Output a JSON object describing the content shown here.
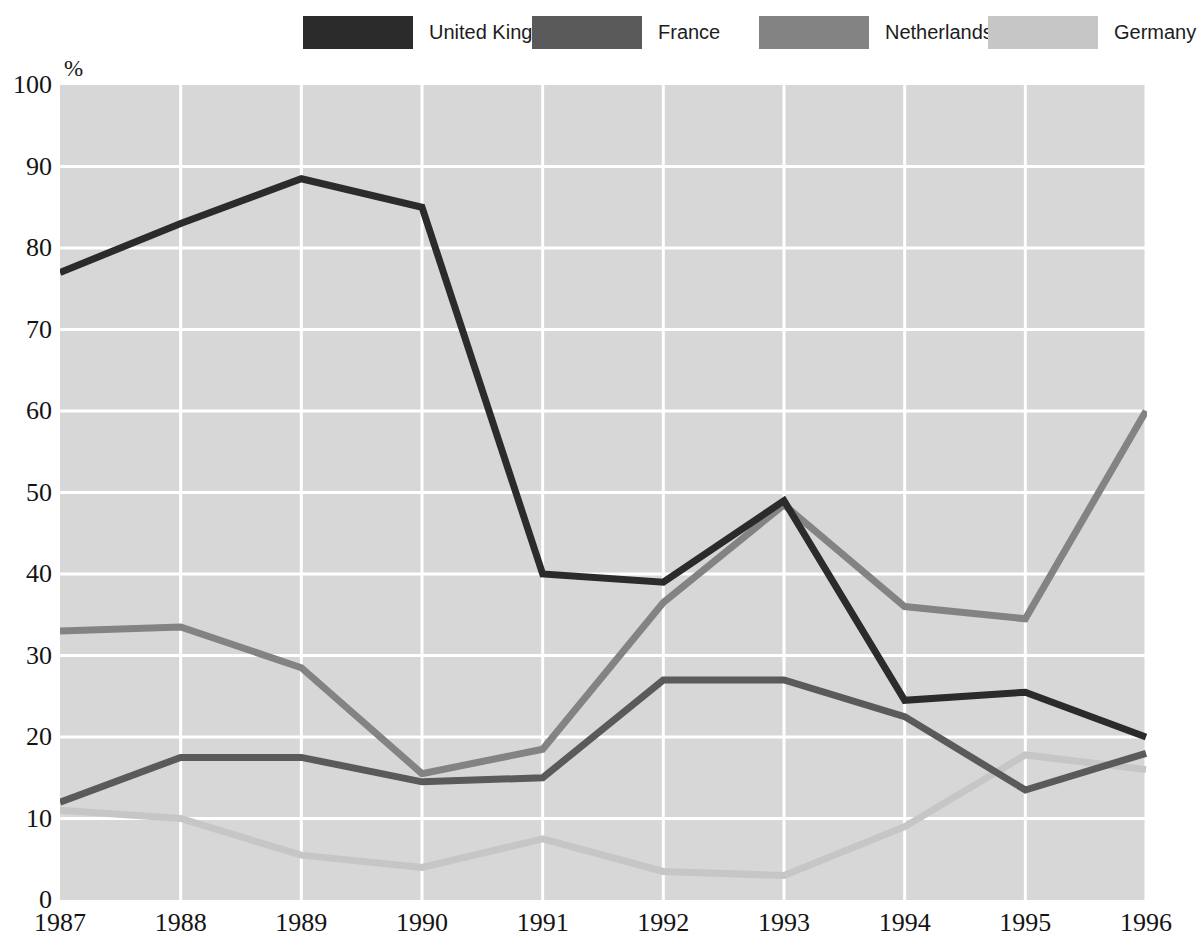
{
  "chart_data": {
    "type": "line",
    "title": "",
    "xlabel": "",
    "ylabel": "%",
    "unit_label": "%",
    "categories": [
      1987,
      1988,
      1989,
      1990,
      1991,
      1992,
      1993,
      1994,
      1995,
      1996
    ],
    "x_tick_labels": [
      "1987",
      "1988",
      "1989",
      "1990",
      "1991",
      "1992",
      "1993",
      "1994",
      "1995",
      "1996"
    ],
    "y_tick_labels": [
      "100",
      "90",
      "80",
      "70",
      "60",
      "50",
      "40",
      "30",
      "20",
      "10",
      "0"
    ],
    "y_ticks": [
      100,
      90,
      80,
      70,
      60,
      50,
      40,
      30,
      20,
      10,
      0
    ],
    "ylim": [
      0,
      100
    ],
    "grid": true,
    "grid_color": "#ffffff",
    "plot_background": "#d7d7d7",
    "legend_position": "top",
    "series": [
      {
        "name": "United Kingdom",
        "color": "#2b2b2b",
        "values": [
          77,
          83,
          88.5,
          85,
          40,
          39,
          49,
          24.5,
          25.5,
          20
        ]
      },
      {
        "name": "France",
        "color": "#5a5a5a",
        "values": [
          12,
          17.5,
          17.5,
          14.5,
          15,
          27,
          27,
          22.5,
          13.5,
          18
        ]
      },
      {
        "name": "Netherlands",
        "color": "#838383",
        "values": [
          33,
          33.5,
          28.5,
          15.5,
          18.5,
          36.5,
          48.5,
          36,
          34.5,
          60
        ]
      },
      {
        "name": "Germany",
        "color": "#c6c6c6",
        "values": [
          11,
          10,
          5.5,
          4,
          7.5,
          3.5,
          3,
          9,
          17.8,
          16
        ]
      }
    ]
  },
  "legend": {
    "items": [
      {
        "label": "United Kingdom",
        "color": "#2b2b2b"
      },
      {
        "label": "France",
        "color": "#5a5a5a"
      },
      {
        "label": "Netherlands",
        "color": "#838383"
      },
      {
        "label": "Germany",
        "color": "#c6c6c6"
      }
    ]
  }
}
